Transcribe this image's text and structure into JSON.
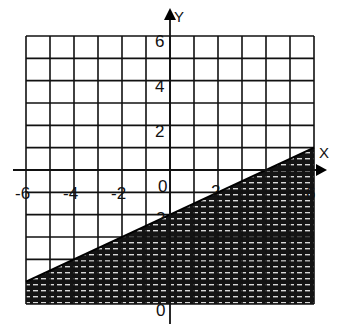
{
  "chart_data": {
    "type": "line",
    "title": "",
    "xlabel": "X",
    "ylabel": "Y",
    "xlim": [
      -6,
      6
    ],
    "ylim": [
      -6,
      6
    ],
    "grid": true,
    "grid_step": 1,
    "x_tick_labels": [
      "-6",
      "-4",
      "-2",
      "0",
      "2",
      "6"
    ],
    "y_tick_labels": [
      "6",
      "4",
      "2",
      "-2",
      "-6"
    ],
    "series": [
      {
        "name": "boundary",
        "equation": "y = 0.5x - 2",
        "x": [
          -6,
          6
        ],
        "y": [
          -5,
          1
        ],
        "style": "solid"
      }
    ],
    "shaded_region": "below boundary line (y < 0.5x - 2)",
    "colors": {
      "grid": "#111111",
      "shade": "#141414",
      "background": "#ffffff"
    }
  },
  "labels": {
    "x_axis": "X",
    "y_axis": "Y",
    "y6": "6",
    "y4": "4",
    "y2": "2",
    "yn2": "2",
    "yn6": "0",
    "xn6": "-6",
    "xn4": "-4",
    "xn2": "-2",
    "x0": "0",
    "x2": "2",
    "x6": "6"
  }
}
